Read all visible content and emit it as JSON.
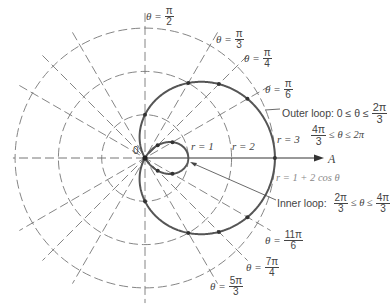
{
  "chart_data": {
    "type": "polar-curve",
    "title": "",
    "curve": {
      "equation": "r = 1 + 2 cos θ",
      "color": "#555555"
    },
    "grid": {
      "circles_r": [
        1,
        2,
        3
      ],
      "radial_line_angles_deg": [
        0,
        30,
        45,
        60,
        90,
        120,
        135,
        150
      ],
      "style": "dashed"
    },
    "polar_axis_label": "A",
    "origin_label": "0",
    "marked_points_theta_deg": [
      0,
      30,
      45,
      60,
      90,
      270,
      300,
      315,
      330,
      150,
      135,
      210,
      225
    ],
    "radius_labels": [
      "r = 1",
      "r = 2",
      "r = 3"
    ],
    "angle_labels": [
      {
        "theta": "π/2"
      },
      {
        "theta": "π/3"
      },
      {
        "theta": "π/4"
      },
      {
        "theta": "π/6"
      },
      {
        "theta": "11π/6"
      },
      {
        "theta": "7π/4"
      },
      {
        "theta": "5π/3"
      }
    ],
    "annotations": [
      "Outer loop: 0 ≤ θ ≤ 2π/3",
      "4π/3 ≤ θ ≤ 2π",
      "r = 1 + 2 cos θ",
      "Inner loop: 2π/3 ≤ θ ≤ 4π/3"
    ]
  },
  "labels": {
    "theta_sym": "θ =",
    "pi_half": {
      "num": "π",
      "den": "2"
    },
    "pi_third": {
      "num": "π",
      "den": "3"
    },
    "pi_quarter": {
      "num": "π",
      "den": "4"
    },
    "pi_sixth": {
      "num": "π",
      "den": "6"
    },
    "eleven_pi_sixth": {
      "num": "11π",
      "den": "6"
    },
    "seven_pi_fourth": {
      "num": "7π",
      "den": "4"
    },
    "five_pi_third": {
      "num": "5π",
      "den": "3"
    },
    "outer_loop_prefix": "Outer loop: 0 ≤ θ ≤",
    "outer_loop_frac": {
      "num": "2π",
      "den": "3"
    },
    "outer_loop_second_frac": {
      "num": "4π",
      "den": "3"
    },
    "outer_loop_second_suffix": "≤ θ ≤ 2π",
    "inner_loop_prefix": "Inner loop:",
    "inner_loop_frac1": {
      "num": "2π",
      "den": "3"
    },
    "inner_loop_mid": "≤ θ ≤",
    "inner_loop_frac2": {
      "num": "4π",
      "den": "3"
    },
    "equation": "r = 1 + 2 cos θ",
    "r1": "r = 1",
    "r2": "r = 2",
    "r3": "r = 3",
    "axis": "A",
    "origin": "0"
  }
}
